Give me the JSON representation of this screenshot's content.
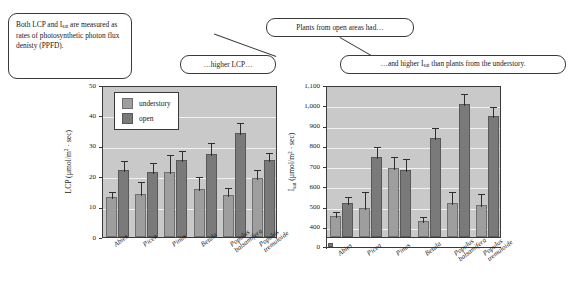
{
  "callouts": {
    "ppfd": "Both LCP and Iₛₐₜ are measured as rates of photosynthetic photon flux denisty (PPFD).",
    "open_areas": "Plants from open areas had…",
    "higher_lcp": "…higher LCP…",
    "higher_isat": "…and higher Iₛₐₜ than plants from the understory."
  },
  "legend": {
    "understory_label": "understory",
    "open_label": "open"
  },
  "colors": {
    "understory": "#9e9e9e",
    "open": "#7a7a7a",
    "plot_background": "#c9c9c9",
    "gridline": "#f2f2f2",
    "axis": "#3a3a3a"
  },
  "chart_data": [
    {
      "id": "lcp",
      "type": "bar",
      "title": "",
      "ylabel": "LCP (µmol/m² · sec)",
      "xlabel": "",
      "ylim": [
        0,
        50
      ],
      "yticks": [
        0,
        10,
        20,
        30,
        40,
        50
      ],
      "ytick_labels": [
        "0",
        "10",
        "20",
        "30",
        "40",
        "50"
      ],
      "grid": true,
      "legend_position": "upper-left",
      "categories": [
        "Abies",
        "Picea",
        "Pinus",
        "Betula",
        "Populus balsamifera",
        "Populus tremuloide"
      ],
      "series": [
        {
          "name": "understory",
          "values": [
            13.0,
            14.3,
            21.5,
            15.7,
            13.8,
            19.3
          ],
          "errors": [
            2.3,
            4.5,
            6.2,
            4.6,
            3.1,
            3.4
          ]
        },
        {
          "name": "open",
          "values": [
            22.2,
            21.4,
            25.4,
            27.3,
            34.2,
            25.3
          ],
          "errors": [
            3.3,
            3.5,
            3.6,
            4.2,
            3.8,
            3.0
          ]
        }
      ]
    },
    {
      "id": "isat",
      "type": "bar",
      "title": "",
      "ylabel": "Iₛₐₜ (µmol/m² · sec)",
      "xlabel": "",
      "ylim": [
        350,
        1100
      ],
      "yticks": [
        400,
        500,
        600,
        700,
        800,
        900,
        1000,
        1100
      ],
      "ytick_labels": [
        "400",
        "500",
        "600",
        "700",
        "800",
        "900",
        "1,000",
        "1,100"
      ],
      "axis_break": true,
      "zero_label": "0",
      "grid": true,
      "legend_position": "none",
      "categories": [
        "Abies",
        "Picea",
        "Pinus",
        "Betula",
        "Populus balsamifera",
        "Populus tremuloide"
      ],
      "series": [
        {
          "name": "understory",
          "values": [
            455,
            493,
            690,
            430,
            520,
            510
          ],
          "errors": [
            30,
            90,
            65,
            28,
            63,
            62
          ]
        },
        {
          "name": "open",
          "values": [
            520,
            745,
            680,
            840,
            1005,
            945
          ],
          "errors": [
            35,
            60,
            65,
            60,
            62,
            55
          ]
        }
      ]
    }
  ]
}
